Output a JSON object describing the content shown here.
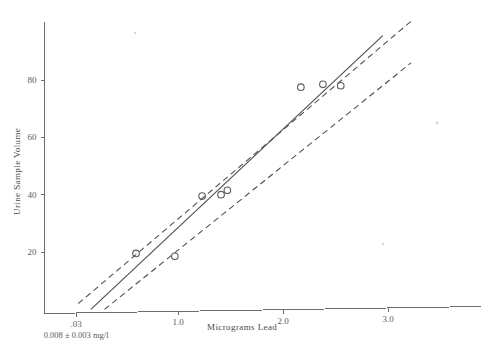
{
  "chart_data": {
    "type": "scatter",
    "title": "",
    "xlabel": "Micrograms Lead",
    "ylabel": "Urine Sample Volume",
    "xlim": [
      0,
      3.25
    ],
    "ylim": [
      0,
      103
    ],
    "grid": false,
    "legend": null,
    "x_ticks": [
      {
        "value": 0.03,
        "label": ".03"
      },
      {
        "value": 1.0,
        "label": "1.0"
      },
      {
        "value": 2.0,
        "label": "2.0"
      },
      {
        "value": 3.0,
        "label": "3.0"
      }
    ],
    "y_ticks": [
      {
        "value": 20,
        "label": "20"
      },
      {
        "value": 40,
        "label": "40"
      },
      {
        "value": 60,
        "label": "60"
      },
      {
        "value": 80,
        "label": "80"
      }
    ],
    "annotation": "0.008 ± 0.003 mg/l",
    "annotation_x": 0.03,
    "series": [
      {
        "name": "observations",
        "marker": "open-circle",
        "points": [
          {
            "x": 0.6,
            "y": 19.5
          },
          {
            "x": 0.97,
            "y": 18.5
          },
          {
            "x": 1.23,
            "y": 39.5
          },
          {
            "x": 1.41,
            "y": 40.0
          },
          {
            "x": 1.47,
            "y": 41.5
          },
          {
            "x": 2.17,
            "y": 77.5
          },
          {
            "x": 2.38,
            "y": 78.5
          },
          {
            "x": 2.55,
            "y": 78.0
          }
        ]
      }
    ],
    "fit_line": {
      "name": "regression-line",
      "style": "solid",
      "x_start": 0.17,
      "y_start": 0.0,
      "x_end": 2.95,
      "y_end": 95.5
    },
    "confidence_bands": [
      {
        "name": "upper-confidence-band",
        "style": "dashed",
        "x_start": 0.05,
        "y_start": 2.0,
        "x_end": 3.22,
        "y_end": 100.5
      },
      {
        "name": "lower-confidence-band",
        "style": "dashed",
        "x_start": 0.3,
        "y_start": 0.0,
        "x_end": 3.22,
        "y_end": 86.0
      }
    ]
  }
}
